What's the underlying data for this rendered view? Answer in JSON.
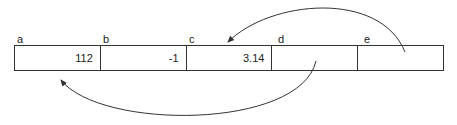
{
  "cells": [
    {
      "name": "a",
      "value": "112"
    },
    {
      "name": "b",
      "value": "-1"
    },
    {
      "name": "c",
      "value": "3.14"
    },
    {
      "name": "d",
      "value": ""
    },
    {
      "name": "e",
      "value": ""
    }
  ],
  "arrows": [
    {
      "from": "e",
      "to": "c"
    },
    {
      "from": "d",
      "to": "a"
    }
  ]
}
